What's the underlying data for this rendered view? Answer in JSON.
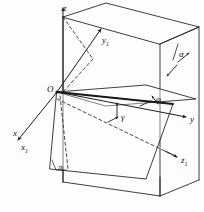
{
  "figure": {
    "type": "geometric-diagram",
    "background_color": "#fdfdfd",
    "stroke_color": "#1b1b1b",
    "plane_fill": "#ffffff"
  },
  "axes": [
    {
      "id": "z",
      "label": "z",
      "sub": "",
      "x": 63,
      "y": 4,
      "desc": "vertical axis pointing up"
    },
    {
      "id": "y",
      "label": "y",
      "sub": "",
      "x": 190,
      "y": 115,
      "desc": "horizontal axis pointing right"
    },
    {
      "id": "x",
      "label": "x",
      "sub": "",
      "x": 13,
      "y": 129,
      "desc": "axis toward lower left"
    },
    {
      "id": "x1",
      "label": "x",
      "sub": "1",
      "x": 20,
      "y": 143,
      "desc": "rotated x axis toward lower left"
    },
    {
      "id": "y1",
      "label": "y",
      "sub": "1",
      "x": 102,
      "y": 36,
      "desc": "rotated y axis toward upper right"
    },
    {
      "id": "z1",
      "label": "z",
      "sub": "1",
      "x": 181,
      "y": 156,
      "desc": "rotated z axis toward lower right"
    }
  ],
  "points": [
    {
      "id": "O",
      "label": "O",
      "x": 57,
      "y": 92,
      "desc": "origin of both coordinate systems"
    }
  ],
  "angles": [
    {
      "id": "alpha",
      "label": "α",
      "x": 179,
      "y": 50,
      "desc": "inclination angle of plane at right edge"
    },
    {
      "id": "phi",
      "label": "φ",
      "x": 156,
      "y": 95,
      "desc": "azimuth angle in the horizontal plane"
    },
    {
      "id": "gamma",
      "label": "γ",
      "x": 121,
      "y": 113,
      "desc": "angle below the horizontal trace line"
    }
  ],
  "planes": [
    {
      "id": "pi",
      "label": "π",
      "x": 58,
      "y": 165,
      "desc": "inclined plane pi label at lower left corner"
    }
  ]
}
